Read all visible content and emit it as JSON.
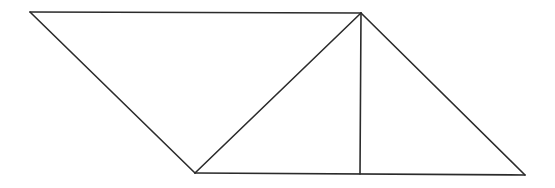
{
  "diagram": {
    "type": "geometric-figure",
    "stroke_color": "#2b2b2b",
    "background": "#ffffff",
    "points": {
      "A": [
        30,
        12
      ],
      "B": [
        361,
        13
      ],
      "C": [
        525,
        175
      ],
      "D": [
        195,
        173
      ],
      "E": [
        360,
        174
      ]
    },
    "segments": [
      {
        "id": "AB",
        "from": "A",
        "to": "B"
      },
      {
        "id": "BC",
        "from": "B",
        "to": "C"
      },
      {
        "id": "DC",
        "from": "D",
        "to": "C"
      },
      {
        "id": "AD",
        "from": "A",
        "to": "D"
      },
      {
        "id": "DB",
        "from": "D",
        "to": "B"
      },
      {
        "id": "BE",
        "from": "B",
        "to": "E"
      }
    ],
    "labels": []
  }
}
